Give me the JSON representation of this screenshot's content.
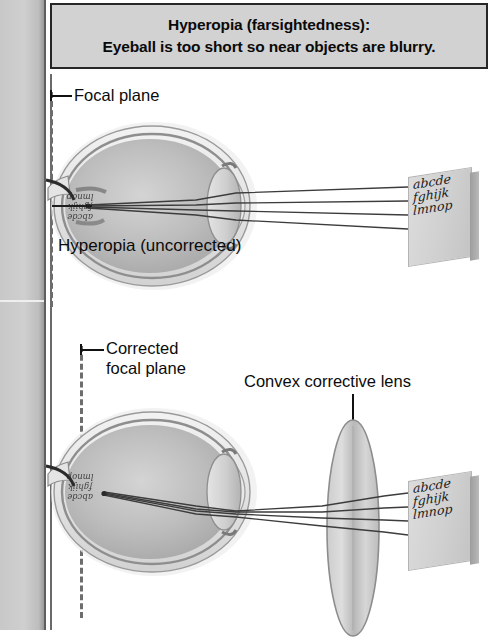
{
  "header": {
    "line1": "Hyperopia (farsightedness):",
    "line2": "Eyeball is too short so near objects are blurry."
  },
  "diagram_top": {
    "focal_plane_label": "Focal plane",
    "caption": "Hyperopia (uncorrected)",
    "target_card": {
      "line1": "abcde",
      "line2": "fghijk",
      "line3": "lmnop"
    },
    "retina_image": {
      "line1": "abcde",
      "line2": "fghijk",
      "line3": "lmnop"
    },
    "ray_count": 4
  },
  "diagram_bottom": {
    "focal_plane_label_line1": "Corrected",
    "focal_plane_label_line2": "focal plane",
    "lens_label": "Convex corrective lens",
    "target_card": {
      "line1": "abcde",
      "line2": "fghijk",
      "line3": "lmnop"
    },
    "retina_image": {
      "line1": "abcde",
      "line2": "fghijk",
      "line3": "lmnop"
    },
    "ray_count": 4
  },
  "colors": {
    "header_background": "#d2d2d2",
    "header_border": "#262626",
    "gutter": "#c8c8c8",
    "ray": "#3c3c3c",
    "focal_dash": "#6d6d6d",
    "text": "#0b0b0b",
    "sclera": "#e8e8e8",
    "vitreous": "#b9b9b9",
    "lens_body": "#cfcfcf"
  }
}
